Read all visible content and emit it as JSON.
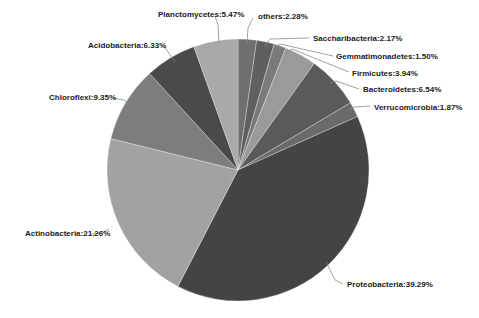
{
  "chart_data": {
    "type": "pie",
    "title": "",
    "start_angle_deg": 0,
    "direction": "clockwise",
    "label_format": "{name}:{value}%",
    "categories": [
      "others",
      "Saccharibacteria",
      "Gemmatimonadetes",
      "Firmicutes",
      "Bacteroidetes",
      "Verrucomicrobia",
      "Proteobacteria",
      "Actinobacteria",
      "Chloroflexi",
      "Acidobacteria",
      "Planctomycetes"
    ],
    "values": [
      2.28,
      2.17,
      1.5,
      3.94,
      6.54,
      1.87,
      39.29,
      21.26,
      9.35,
      6.33,
      5.47
    ],
    "colors": [
      "#6f6f6f",
      "#5f5f5f",
      "#7a7a7a",
      "#9a9a9a",
      "#5a5a5a",
      "#6a6a6a",
      "#444444",
      "#a2a2a2",
      "#7d7d7d",
      "#4a4a4a",
      "#a9a9a9"
    ],
    "labels": [
      {
        "text": "others:2.28%",
        "x": 258,
        "y": 19,
        "anchor": "start",
        "leader": "M 247 44 L 248 28 L 253 18"
      },
      {
        "text": "Saccharibacteria:2.17%",
        "x": 313,
        "y": 41,
        "anchor": "start",
        "leader": "M 265 46 L 270 39 L 309 38"
      },
      {
        "text": "Gemmatimonadetes:1.50%",
        "x": 336,
        "y": 59,
        "anchor": "start",
        "leader": "M 275 48 L 280 44 L 333 56"
      },
      {
        "text": "Firmicutes:3.94%",
        "x": 352,
        "y": 76,
        "anchor": "start",
        "leader": "M 286 53 L 292 49 L 349 72"
      },
      {
        "text": "Bacteroidetes:6.54%",
        "x": 363,
        "y": 92,
        "anchor": "start",
        "leader": "M 330 83 L 336 81 L 359 89"
      },
      {
        "text": "Verrucomicrobia:1.87%",
        "x": 374,
        "y": 110,
        "anchor": "start",
        "leader": "M 349 110 L 355 107 L 370 106"
      },
      {
        "text": "Proteobacteria:39.29%",
        "x": 347,
        "y": 287,
        "anchor": "start",
        "leader": "M 326 262 L 335 280 L 343 284"
      },
      {
        "text": "Actinobacteria:21.26%",
        "x": 25,
        "y": 236,
        "anchor": "start",
        "leader": "M 109 229 L 102 233 L 91 234"
      },
      {
        "text": "Chloroflexi:9.35%",
        "x": 49,
        "y": 100,
        "anchor": "start",
        "leader": "M 133 108 L 124 100 L 113 98"
      },
      {
        "text": "Acidobacteria:6.33%",
        "x": 88,
        "y": 48,
        "anchor": "start",
        "leader": "M 175 62 L 166 49 L 162 46"
      },
      {
        "text": "Planctomycetes:5.47%",
        "x": 158,
        "y": 17,
        "anchor": "start",
        "leader": "M 219 43 L 218 25 L 215 16"
      }
    ],
    "legend": "none",
    "grid": false
  },
  "pie": {
    "cx": 238,
    "cy": 170,
    "r": 131
  }
}
